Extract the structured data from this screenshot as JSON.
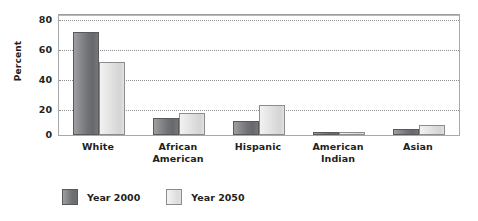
{
  "chart_data": {
    "type": "bar",
    "title": "",
    "xlabel": "",
    "ylabel": "Percent",
    "ylim": [
      0,
      80
    ],
    "yticks": [
      0,
      20,
      40,
      60,
      80
    ],
    "grid": true,
    "legend_position": "bottom-left",
    "categories": [
      "White",
      "African American",
      "Hispanic",
      "American Indian",
      "Asian"
    ],
    "series": [
      {
        "name": "Year 2000",
        "color": "#74767a",
        "values": [
          72,
          12,
          10,
          1,
          4
        ]
      },
      {
        "name": "Year 2050",
        "color": "#e2e2e2",
        "values": [
          51,
          15,
          21,
          1,
          7
        ]
      }
    ]
  },
  "axes": {
    "y_title": "Percent",
    "y_tick_labels": [
      "80",
      "60",
      "40",
      "20",
      "0"
    ],
    "x_tick_labels": [
      {
        "line1": "White",
        "line2": ""
      },
      {
        "line1": "African",
        "line2": "American"
      },
      {
        "line1": "Hispanic",
        "line2": ""
      },
      {
        "line1": "American",
        "line2": "Indian"
      },
      {
        "line1": "Asian",
        "line2": ""
      }
    ]
  },
  "legend": {
    "items": [
      {
        "label": "Year 2000",
        "swatch": "dark-gray-gradient"
      },
      {
        "label": "Year 2050",
        "swatch": "light-gray-gradient"
      }
    ]
  }
}
